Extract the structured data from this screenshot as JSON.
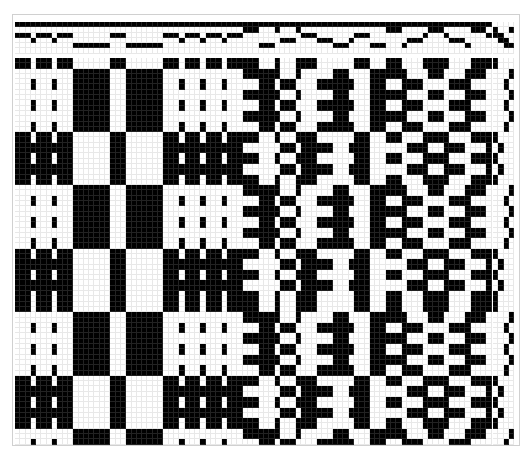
{
  "draft": {
    "cell_px": 5.3,
    "colors": {
      "filled": "#000000",
      "empty": "#ffffff",
      "grid": "#e8e8e8"
    },
    "shafts": 4,
    "treadles": 4,
    "threading_repeat": [
      1,
      1,
      1,
      2,
      1,
      1,
      1,
      2,
      1,
      1,
      1,
      3,
      3,
      3,
      3,
      3,
      3,
      3,
      1,
      1,
      1,
      3,
      3,
      3,
      3,
      3,
      3,
      3,
      1,
      1,
      1,
      2,
      1,
      1,
      1,
      2,
      1,
      1,
      1,
      2,
      1,
      1,
      1,
      0,
      0,
      0,
      3,
      3,
      3,
      0,
      2,
      2,
      2,
      0,
      1,
      1,
      1,
      2,
      2,
      2,
      3,
      3,
      3,
      2,
      1,
      1,
      1,
      3,
      3,
      3,
      0,
      0,
      0,
      3,
      2,
      2,
      2,
      1,
      0,
      0,
      0,
      1,
      2,
      2,
      2,
      3,
      0,
      0,
      0
    ],
    "tieup": [
      [
        1,
        0,
        0,
        1
      ],
      [
        1,
        1,
        0,
        0
      ],
      [
        0,
        1,
        1,
        0
      ],
      [
        0,
        0,
        1,
        1
      ]
    ],
    "treadling_repeat": [
      0,
      0,
      3,
      3,
      2,
      2,
      3,
      3,
      2,
      2,
      3,
      3,
      2,
      2,
      0,
      0,
      1,
      1,
      0,
      0,
      1,
      1,
      0,
      0,
      3,
      3,
      2,
      2,
      3,
      3,
      2,
      2,
      3,
      3,
      2,
      2,
      0,
      0,
      1,
      1,
      0,
      0,
      1,
      1,
      0,
      0
    ]
  }
}
